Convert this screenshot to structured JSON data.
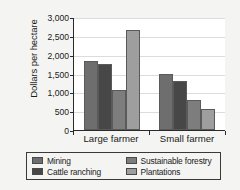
{
  "chart_data": {
    "type": "bar",
    "title": "",
    "xlabel": "",
    "ylabel": "Dollars per hectare",
    "categories": [
      "Large farmer",
      "Small farmer"
    ],
    "series": [
      {
        "name": "Mining",
        "color": "#6e6e6e",
        "values": [
          1830,
          1500
        ]
      },
      {
        "name": "Cattle ranching",
        "color": "#474747",
        "values": [
          1760,
          1310
        ]
      },
      {
        "name": "Sustainable forestry",
        "color": "#7d7d7d",
        "values": [
          1070,
          810
        ]
      },
      {
        "name": "Plantations",
        "color": "#9e9e9e",
        "values": [
          2650,
          570
        ]
      }
    ],
    "ylim": [
      0,
      3000
    ],
    "ytick_labels": [
      "0",
      "500",
      "1,000",
      "1,500",
      "2,000",
      "2,500",
      "3,000"
    ],
    "ytick_values": [
      0,
      500,
      1000,
      1500,
      2000,
      2500,
      3000
    ],
    "grid": true,
    "legend_position": "bottom",
    "legend_entries": [
      "Mining",
      "Cattle ranching",
      "Sustainable forestry",
      "Plantations"
    ]
  }
}
